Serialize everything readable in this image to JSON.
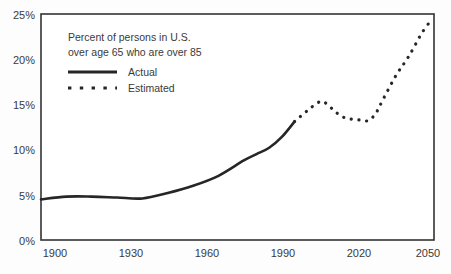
{
  "chart_data": {
    "type": "line",
    "title": "",
    "caption_lines": [
      "Percent of persons in U.S.",
      "over age 65 who are over 85"
    ],
    "xlabel": "",
    "ylabel": "",
    "xlim": [
      1900,
      2055
    ],
    "ylim": [
      0,
      25
    ],
    "grid": false,
    "legend_position": "upper-left-inside",
    "x_tick_labels": [
      "1900",
      "1930",
      "1960",
      "1990",
      "2020",
      "2050"
    ],
    "x_tick_values": [
      1900,
      1930,
      1960,
      1990,
      2020,
      2050
    ],
    "y_tick_labels": [
      "0%",
      "5%",
      "10%",
      "15%",
      "20%",
      "25%"
    ],
    "y_tick_values": [
      0,
      5,
      10,
      15,
      20,
      25
    ],
    "series": [
      {
        "name": "Actual",
        "style": "solid",
        "color": "#262626",
        "x": [
          1900,
          1910,
          1920,
          1930,
          1940,
          1950,
          1960,
          1970,
          1980,
          1985,
          1990,
          1995,
          2000
        ],
        "values": [
          4.5,
          4.8,
          4.8,
          4.7,
          4.6,
          5.2,
          6.0,
          7.1,
          8.8,
          9.5,
          10.2,
          11.4,
          13.1
        ]
      },
      {
        "name": "Estimated",
        "style": "dotted",
        "color": "#262626",
        "x": [
          2000,
          2005,
          2010,
          2013,
          2016,
          2020,
          2025,
          2029,
          2032,
          2035,
          2040,
          2045,
          2050,
          2053
        ],
        "values": [
          13.1,
          14.3,
          15.3,
          15.0,
          14.2,
          13.5,
          13.3,
          13.2,
          14.0,
          15.6,
          18.2,
          20.3,
          22.8,
          24.0
        ]
      }
    ],
    "legend": [
      {
        "label": "Actual",
        "style": "solid"
      },
      {
        "label": "Estimated",
        "style": "dotted"
      }
    ],
    "colors": {
      "line": "#262626",
      "axis": "#333333",
      "text": "#3a3a3a",
      "background": "#fdfdfd"
    }
  }
}
